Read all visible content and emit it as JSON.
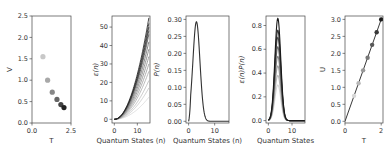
{
  "chart_data": [
    {
      "type": "scatter",
      "title": "",
      "xlabel": "T",
      "ylabel": "V",
      "xlim": [
        0.0,
        2.5
      ],
      "ylim": [
        0.0,
        2.5
      ],
      "xticks": [
        "0.0",
        "2.5"
      ],
      "yticks": [
        "0.0",
        "0.5",
        "1.0",
        "1.5",
        "2.0",
        "2.5"
      ],
      "x": [
        0.7,
        1.0,
        1.3,
        1.6,
        1.85,
        2.05
      ],
      "y": [
        1.55,
        1.0,
        0.72,
        0.55,
        0.43,
        0.36
      ],
      "colors": [
        "#c8c8c8",
        "#a8a8a8",
        "#888888",
        "#666666",
        "#444444",
        "#222222"
      ],
      "grid": false
    },
    {
      "type": "line",
      "title": "",
      "xlabel": "Quantum States (n)",
      "ylabel": "ε(n)",
      "xlim": [
        -1,
        15.5
      ],
      "ylim": [
        -2,
        56
      ],
      "xticks": [
        "0",
        "10"
      ],
      "yticks": [
        "0",
        "10",
        "20",
        "30",
        "40",
        "50"
      ],
      "x": [
        0,
        1,
        2,
        3,
        4,
        5,
        6,
        7,
        8,
        9,
        10,
        11,
        12,
        13,
        14,
        15
      ],
      "series_note": "family of quadratic curves ε = c·n², end values at n=15",
      "series_end_values": [
        12,
        17,
        21,
        26,
        30,
        34,
        38,
        42,
        46,
        48,
        50,
        52,
        55
      ],
      "grid": false
    },
    {
      "type": "line",
      "title": "",
      "xlabel": "Quantum States (n)",
      "ylabel": "P(n)",
      "xlim": [
        -1,
        15.5
      ],
      "ylim": [
        -0.005,
        0.31
      ],
      "xticks": [
        "0",
        "10"
      ],
      "yticks": [
        "0.00",
        "0.05",
        "0.10",
        "0.15",
        "0.20",
        "0.25",
        "0.30"
      ],
      "x": [
        0,
        1,
        2,
        3,
        4,
        5,
        6,
        7,
        8,
        9,
        10,
        12,
        15
      ],
      "y": [
        0.0,
        0.09,
        0.24,
        0.29,
        0.22,
        0.11,
        0.04,
        0.01,
        0.003,
        0.0,
        0.0,
        0.0,
        0.0
      ],
      "grid": false
    },
    {
      "type": "line",
      "title": "",
      "xlabel": "Quantum States",
      "ylabel": "ε(n)P(n)",
      "xlim": [
        -1,
        15.5
      ],
      "ylim": [
        -0.02,
        0.88
      ],
      "xticks": [
        "0",
        "10"
      ],
      "yticks": [
        "0.0",
        "0.2",
        "0.4",
        "0.6",
        "0.8"
      ],
      "x": [
        0,
        1,
        2,
        3,
        4,
        5,
        6,
        7,
        8,
        9,
        10,
        15
      ],
      "series_note": "family of peaked curves centered near n=4, peak heights",
      "series_peaks": [
        0.3,
        0.38,
        0.46,
        0.54,
        0.62,
        0.7,
        0.76,
        0.86
      ],
      "grid": false
    },
    {
      "type": "line",
      "title": "",
      "xlabel": "T",
      "ylabel": "U",
      "xlim": [
        0,
        2.1
      ],
      "ylim": [
        -0.05,
        3.1
      ],
      "xticks": [
        "0",
        "2"
      ],
      "yticks": [
        "0.0",
        "0.5",
        "1.0",
        "1.5",
        "2.0",
        "2.5",
        "3.0"
      ],
      "line": {
        "x": [
          0,
          2.0
        ],
        "y": [
          0,
          3.0
        ]
      },
      "markers": {
        "x": [
          0.5,
          0.75,
          1.0,
          1.25,
          1.5,
          1.75,
          2.0
        ],
        "y": [
          0.75,
          1.12,
          1.5,
          1.87,
          2.25,
          2.62,
          3.0
        ]
      },
      "grid": false
    }
  ]
}
